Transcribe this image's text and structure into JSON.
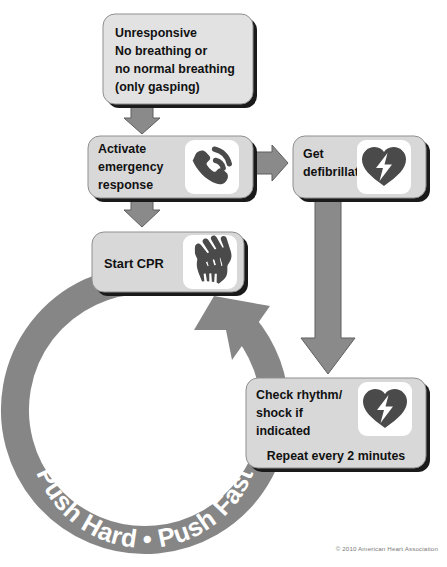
{
  "poster": {
    "title": "Adult Basic Life Support Simplified Algorithm",
    "copyright": "© 2010 American Heart Association",
    "ring_label": "Push Hard • Push Fast"
  },
  "colors": {
    "box_fill_light": "#d8d8d8",
    "box_fill_top": "#e8e8e8",
    "box_shadow": "#1a1a1a",
    "arrow_gray": "#8a8a8a",
    "arrow_stroke": "#5f5f5f",
    "ring_gray": "#868686",
    "icon_dark": "#4a4a4a",
    "icon_plate": "#ffffff",
    "text_dark": "#111111",
    "copyright_gray": "#7a7a7a",
    "page_bg": "#ffffff"
  },
  "nodes": [
    {
      "id": "unresponsive",
      "name": "unresponsive-box",
      "lines": [
        "Unresponsive",
        "No breathing or",
        "no normal breathing",
        "(only gasping)"
      ],
      "icon": null
    },
    {
      "id": "activate",
      "name": "activate-emergency-response-box",
      "lines": [
        "Activate",
        "emergency",
        "response"
      ],
      "icon": "phone-icon"
    },
    {
      "id": "defibrillator",
      "name": "get-defibrillator-box",
      "lines": [
        "Get",
        "defibrillator"
      ],
      "icon": "aed-heart-bolt-icon"
    },
    {
      "id": "cpr",
      "name": "start-cpr-box",
      "lines": [
        "Start CPR"
      ],
      "icon": "cpr-hands-icon"
    },
    {
      "id": "rhythm",
      "name": "check-rhythm-box",
      "lines": [
        "Check rhythm/",
        "shock if",
        "indicated"
      ],
      "footer": "Repeat every 2 minutes",
      "icon": "aed-heart-bolt-icon"
    }
  ],
  "connectors": [
    {
      "id": "c1",
      "name": "arrow-unresponsive-to-activate",
      "direction": "down"
    },
    {
      "id": "c2",
      "name": "arrow-activate-to-defibrillator",
      "direction": "right"
    },
    {
      "id": "c3",
      "name": "arrow-activate-to-cpr",
      "direction": "down"
    },
    {
      "id": "c4",
      "name": "arrow-defibrillator-to-check-rhythm",
      "direction": "down-long"
    },
    {
      "id": "c5",
      "name": "cpr-cycle-ring-arrow",
      "direction": "clockwise-loop"
    }
  ]
}
